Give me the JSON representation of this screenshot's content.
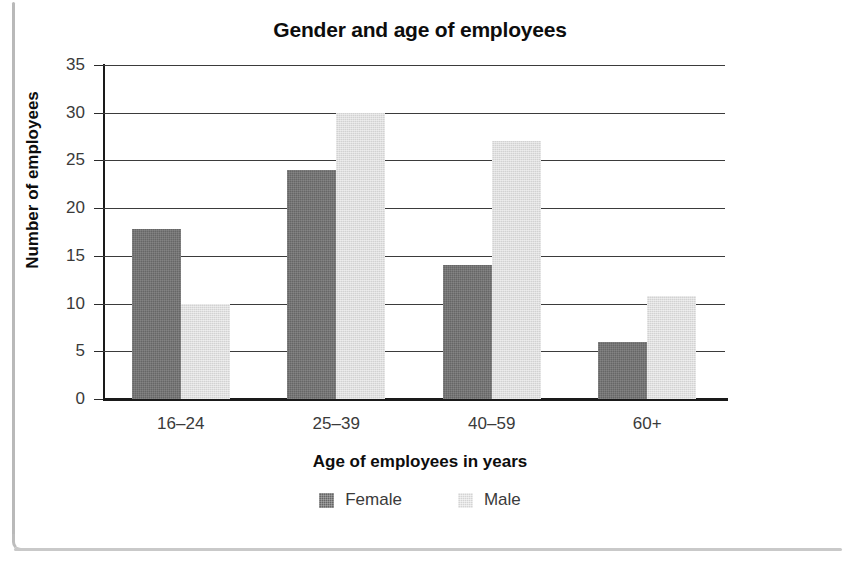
{
  "page": {
    "top_clipped_text": "",
    "background": "#ffffff"
  },
  "colors": {
    "female_bar": "#666666",
    "male_bar": "#d2d2d2",
    "axis": "#1a1a1a",
    "gridline": "#3b3b3b",
    "text": "#0d0d0d",
    "tick_text": "#3a3a3a"
  },
  "chart_data": {
    "type": "bar",
    "title": "Gender and age of employees",
    "xlabel": "Age of employees in years",
    "ylabel": "Number of employees",
    "categories": [
      "16–24",
      "25–39",
      "40–59",
      "60+"
    ],
    "series": [
      {
        "name": "Female",
        "color": "#666666",
        "values": [
          17.8,
          24,
          14,
          6
        ]
      },
      {
        "name": "Male",
        "color": "#d2d2d2",
        "values": [
          10,
          30,
          27,
          10.8
        ]
      }
    ],
    "ylim": [
      0,
      35
    ],
    "ytick_labels": [
      "35",
      "30",
      "25",
      "20",
      "15",
      "10",
      "5",
      "0"
    ],
    "ytick_values": [
      35,
      30,
      25,
      20,
      15,
      10,
      5,
      0
    ],
    "ytick_step": 5,
    "grid": "horizontal",
    "legend_position": "bottom",
    "legend": [
      "Female",
      "Male"
    ]
  }
}
